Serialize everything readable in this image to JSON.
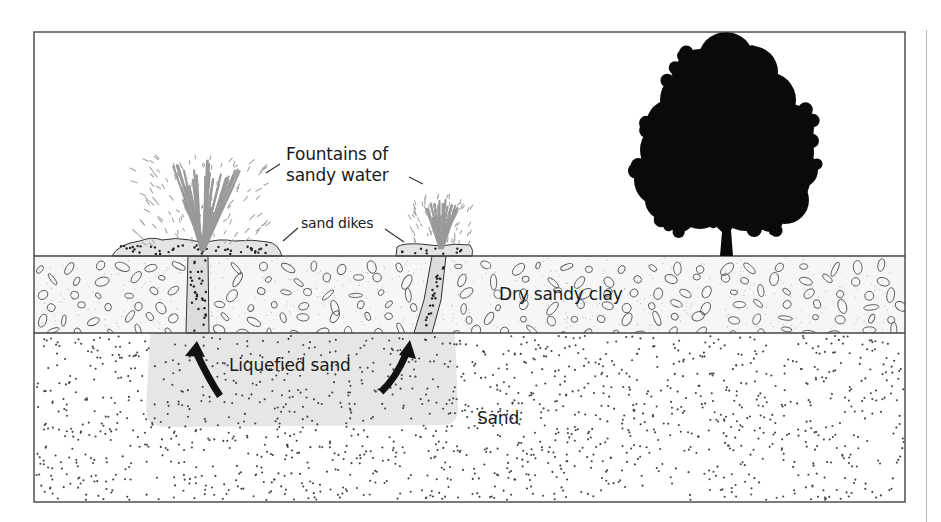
{
  "diagram": {
    "type": "cross-section",
    "labels": {
      "fountains": [
        "Fountains of",
        "sandy water"
      ],
      "sand_dikes": "sand dikes",
      "dry_sandy_clay": "Dry sandy clay",
      "liquefied_sand": "Liquefied sand",
      "sand": "Sand"
    },
    "layers": [
      {
        "name": "Air / surface",
        "top": 32,
        "bottom": 256,
        "fill": "#ffffff"
      },
      {
        "name": "Dry sandy clay",
        "top": 256,
        "bottom": 333,
        "fill": "#f6f6f6",
        "pattern": "ovals"
      },
      {
        "name": "Sand",
        "top": 333,
        "bottom": 502,
        "fill": "#ffffff",
        "pattern": "dots"
      }
    ],
    "features": [
      {
        "name": "Liquefied sand zone",
        "x": [
          145,
          455
        ],
        "y": [
          333,
          425
        ],
        "fill": "#e6e6e6"
      },
      {
        "name": "Large fountain",
        "x": 200,
        "top": 150
      },
      {
        "name": "Small fountain",
        "x": 440,
        "top": 195
      },
      {
        "name": "Tree silhouette",
        "x": 725,
        "top": 45
      }
    ],
    "colors": {
      "outline": "#333333",
      "fountain": "#9a9a9a",
      "liquefied": "#e6e6e6",
      "tree": "#0a0a0a",
      "clay_fill": "#f6f6f6",
      "dots": "#444444"
    }
  }
}
